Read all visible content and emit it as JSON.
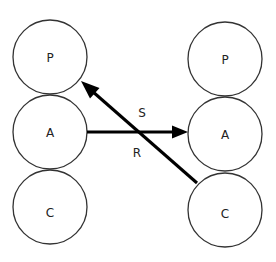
{
  "diagram": {
    "title": "",
    "left_column": {
      "nodes": [
        {
          "id": "P_left",
          "label": "P",
          "cx": 50,
          "cy": 57,
          "r": 37
        },
        {
          "id": "A_left",
          "label": "A",
          "cx": 50,
          "cy": 132,
          "r": 37
        },
        {
          "id": "C_left",
          "label": "C",
          "cx": 50,
          "cy": 207,
          "r": 37
        }
      ]
    },
    "right_column": {
      "nodes": [
        {
          "id": "P_right",
          "label": "P",
          "cx": 225,
          "cy": 59,
          "r": 37
        },
        {
          "id": "A_right",
          "label": "A",
          "cx": 225,
          "cy": 134,
          "r": 37
        },
        {
          "id": "C_right",
          "label": "C",
          "cx": 225,
          "cy": 210,
          "r": 37
        }
      ]
    },
    "edges": [
      {
        "id": "R",
        "label": "R",
        "from": "A_left",
        "to": "A_right",
        "x1": 87,
        "y1": 132,
        "x2": 187,
        "y2": 132,
        "label_x": 137,
        "label_y": 153
      },
      {
        "id": "S",
        "label": "S",
        "from": "C_right",
        "to": "P_left",
        "x1": 197,
        "y1": 183,
        "x2": 82,
        "y2": 82,
        "label_x": 142,
        "label_y": 113
      }
    ],
    "colors": {
      "node_stroke": "#333333",
      "edge": "#000000",
      "text": "#222222",
      "background": "#ffffff"
    }
  }
}
